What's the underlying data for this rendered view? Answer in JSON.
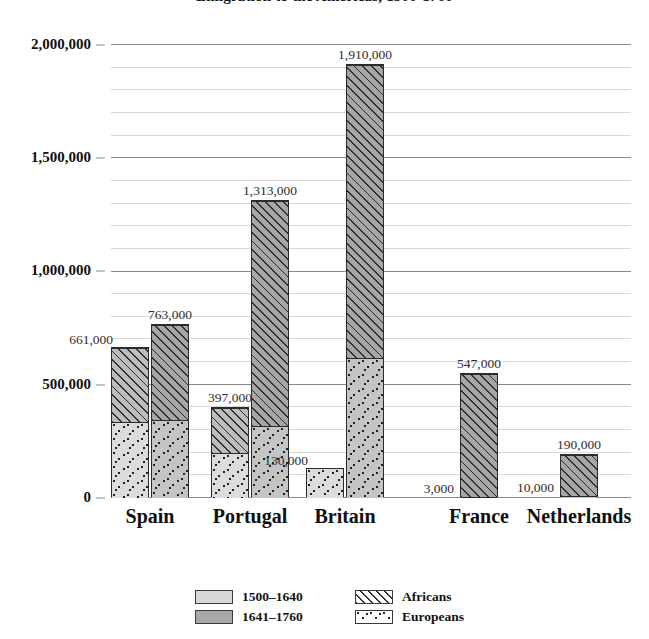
{
  "chart_data": {
    "type": "bar",
    "title": "Emigration to the Americas, 1500-1760",
    "xlabel": "",
    "ylabel": "",
    "ylim": [
      0,
      2000000
    ],
    "grid": true,
    "legend_position": "bottom",
    "stacked": true,
    "grouped": true,
    "categories": [
      "Spain",
      "Portugal",
      "Britain",
      "France",
      "Netherlands"
    ],
    "y_ticks": [
      "0",
      "500,000",
      "1,000,000",
      "1,500,000",
      "2,000,000"
    ],
    "y_tick_values": [
      0,
      500000,
      1000000,
      1500000,
      2000000
    ],
    "minor_tick_interval": 100000,
    "period_series": [
      {
        "name": "1500–1640",
        "color": "#d8d8d8"
      },
      {
        "name": "1641–1760",
        "color": "#a8a8a8"
      }
    ],
    "stack_series": [
      {
        "name": "Africans",
        "pattern": "diagonal-hatch"
      },
      {
        "name": "Europeans",
        "pattern": "dots"
      }
    ],
    "bars": [
      {
        "category": "Spain",
        "period": "1500–1640",
        "total": 661000,
        "label": "661,000",
        "europeans": 335000,
        "africans": 326000
      },
      {
        "category": "Spain",
        "period": "1641–1760",
        "total": 763000,
        "label": "763,000",
        "europeans": 345000,
        "africans": 418000
      },
      {
        "category": "Portugal",
        "period": "1500–1640",
        "total": 397000,
        "label": "397,000",
        "europeans": 200000,
        "africans": 197000
      },
      {
        "category": "Portugal",
        "period": "1641–1760",
        "total": 1313000,
        "label": "1,313,000",
        "europeans": 320000,
        "africans": 993000
      },
      {
        "category": "Britain",
        "period": "1500–1640",
        "total": 130000,
        "label": "130,000",
        "europeans": 130000,
        "africans": 0
      },
      {
        "category": "Britain",
        "period": "1641–1760",
        "total": 1910000,
        "label": "1,910,000",
        "europeans": 620000,
        "africans": 1290000
      },
      {
        "category": "France",
        "period": "1641–1760",
        "total": 547000,
        "label": "547,000",
        "europeans": 3000,
        "africans": 544000,
        "europeans_label": "3,000"
      },
      {
        "category": "Netherlands",
        "period": "1641–1760",
        "total": 190000,
        "label": "190,000",
        "europeans": 10000,
        "africans": 180000,
        "europeans_label": "10,000"
      }
    ]
  },
  "legend": {
    "rows": [
      {
        "left_label": "1500–1640",
        "right_label": "Africans"
      },
      {
        "left_label": "1641–1760",
        "right_label": "Europeans"
      }
    ]
  }
}
